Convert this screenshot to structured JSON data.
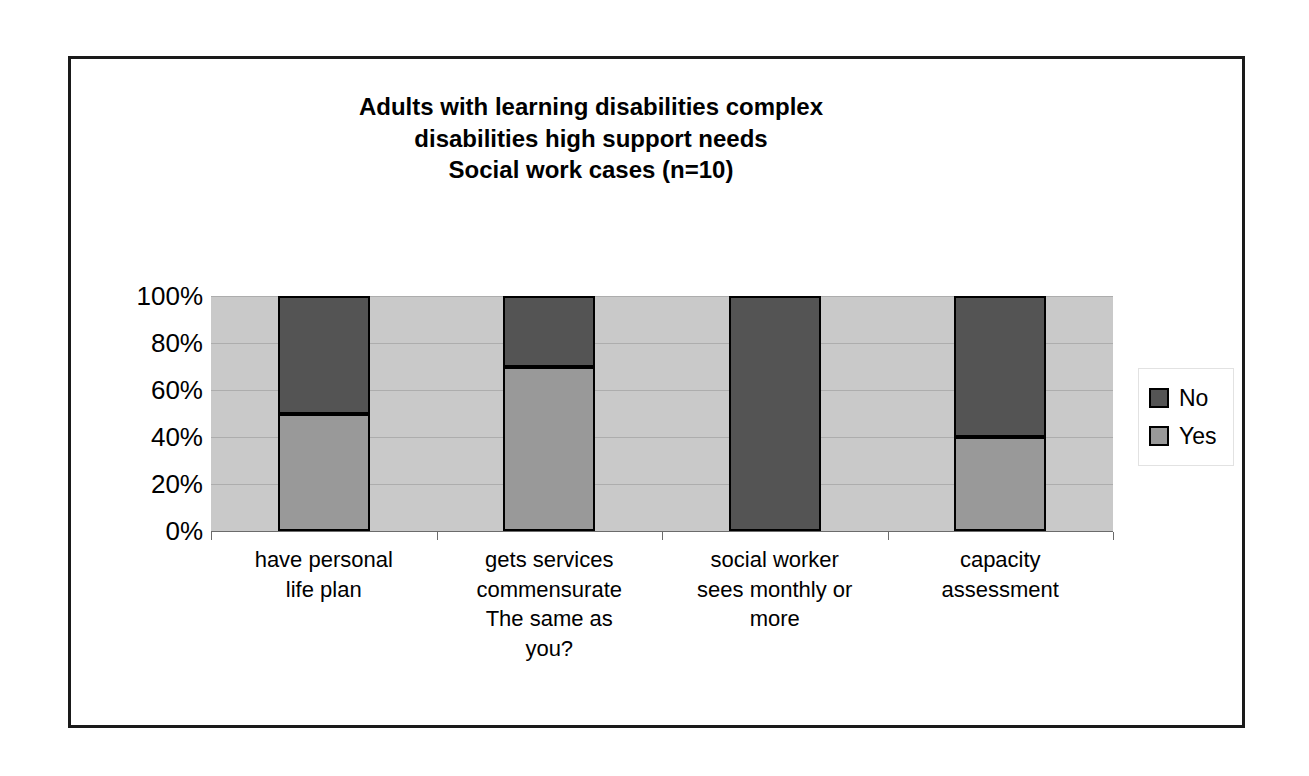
{
  "chart_data": {
    "type": "bar",
    "subtype": "stacked-percent",
    "title": "Adults with learning disabilities complex\ndisabilities high support needs\nSocial work cases (n=10)",
    "xlabel": "",
    "ylabel": "",
    "ylim": [
      0,
      100
    ],
    "yticks": [
      "0%",
      "20%",
      "40%",
      "60%",
      "80%",
      "100%"
    ],
    "ytick_values": [
      0,
      20,
      40,
      60,
      80,
      100
    ],
    "grid": true,
    "legend_position": "right",
    "categories": [
      "have personal\nlife plan",
      "gets services\ncommensurate\nThe same as\nyou?",
      "social worker\nsees monthly or\nmore",
      "capacity\nassessment"
    ],
    "series": [
      {
        "name": "No",
        "color": "#545454",
        "values": [
          50,
          30,
          100,
          60
        ]
      },
      {
        "name": "Yes",
        "color": "#999999",
        "values": [
          50,
          70,
          0,
          40
        ]
      }
    ]
  },
  "colors": {
    "plot_background": "#c9c9c9",
    "gridline": "#adadad",
    "frame": "#1a1a1a",
    "no": "#545454",
    "yes": "#999999"
  }
}
